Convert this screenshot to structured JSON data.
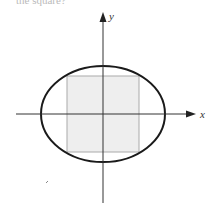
{
  "caption": {
    "text": "the square?"
  },
  "figure": {
    "x_axis_label": "x",
    "y_axis_label": "y",
    "ellipse": {
      "cx": 103,
      "cy": 114,
      "rx": 62,
      "ry": 48,
      "stroke": "#1a1a1a"
    },
    "square": {
      "x": 67,
      "y": 76,
      "size": 72,
      "fill": "#eeeeee",
      "stroke": "#aaaaaa"
    },
    "colors": {
      "axis": "#333333",
      "background": "#ffffff"
    }
  }
}
